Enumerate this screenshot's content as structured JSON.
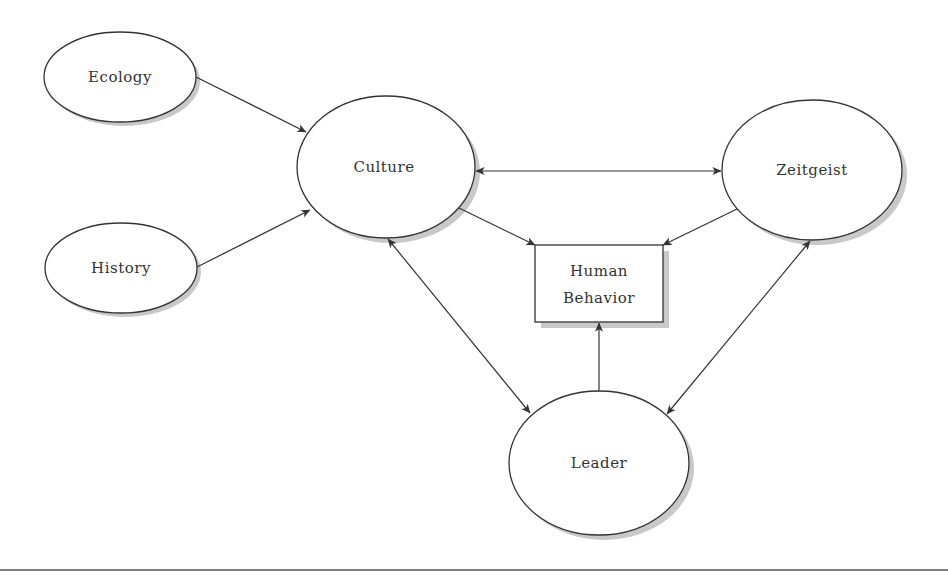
{
  "diagram": {
    "nodes": [
      {
        "id": "ecology",
        "label": "Ecology",
        "shape": "ellipse",
        "cx": 120,
        "cy": 77,
        "rx": 76,
        "ry": 45
      },
      {
        "id": "history",
        "label": "History",
        "shape": "ellipse",
        "cx": 121,
        "cy": 268,
        "rx": 76,
        "ry": 45
      },
      {
        "id": "culture",
        "label": "Culture",
        "shape": "ellipse",
        "cx": 386,
        "cy": 167,
        "rx": 89,
        "ry": 71
      },
      {
        "id": "zeitgeist",
        "label": "Zeitgeist",
        "shape": "ellipse",
        "cx": 812,
        "cy": 170,
        "rx": 90,
        "ry": 70
      },
      {
        "id": "leader",
        "label": "Leader",
        "shape": "ellipse",
        "cx": 599,
        "cy": 463,
        "rx": 90,
        "ry": 72
      },
      {
        "id": "human-behavior",
        "label_line1": "Human",
        "label_line2": "Behavior",
        "shape": "rect",
        "x": 535,
        "y": 245,
        "w": 128,
        "h": 77
      }
    ],
    "edges": [
      {
        "from": "ecology",
        "to": "culture",
        "direction": "forward"
      },
      {
        "from": "history",
        "to": "culture",
        "direction": "forward"
      },
      {
        "from": "culture",
        "to": "zeitgeist",
        "direction": "both"
      },
      {
        "from": "culture",
        "to": "human-behavior",
        "direction": "forward"
      },
      {
        "from": "zeitgeist",
        "to": "human-behavior",
        "direction": "forward"
      },
      {
        "from": "culture",
        "to": "leader",
        "direction": "both"
      },
      {
        "from": "zeitgeist",
        "to": "leader",
        "direction": "both"
      },
      {
        "from": "leader",
        "to": "human-behavior",
        "direction": "forward"
      }
    ],
    "labels": {
      "ecology": "Ecology",
      "history": "History",
      "culture": "Culture",
      "zeitgeist": "Zeitgeist",
      "leader": "Leader",
      "human_behavior_line1": "Human",
      "human_behavior_line2": "Behavior"
    },
    "colors": {
      "stroke": "#333333",
      "shadow": "#c8c8c8",
      "background": "#ffffff"
    }
  }
}
